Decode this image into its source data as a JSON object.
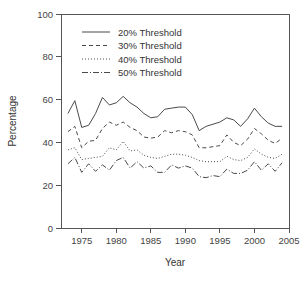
{
  "chart_data": {
    "type": "line",
    "title": "",
    "xlabel": "Year",
    "ylabel": "Percentage",
    "xlim": [
      1972,
      2005
    ],
    "ylim": [
      0,
      100
    ],
    "xticks": [
      1975,
      1980,
      1985,
      1990,
      1995,
      2000,
      2005
    ],
    "xtick_labels": [
      "1975",
      "1980",
      "1985",
      "1990",
      "1995",
      "2000",
      "2005"
    ],
    "yticks": [
      0,
      20,
      40,
      60,
      80,
      100
    ],
    "ytick_labels": [
      "0",
      "20",
      "40",
      "60",
      "80",
      "100"
    ],
    "grid": false,
    "legend_position": "top-left",
    "x": [
      1973,
      1974,
      1975,
      1976,
      1977,
      1978,
      1979,
      1980,
      1981,
      1982,
      1983,
      1984,
      1985,
      1986,
      1987,
      1988,
      1989,
      1990,
      1991,
      1992,
      1993,
      1994,
      1995,
      1996,
      1997,
      1998,
      1999,
      2000,
      2001,
      2002,
      2003,
      2004
    ],
    "series": [
      {
        "name": "20% Threshold",
        "dash": "none",
        "color": "#4a4a4a",
        "values": [
          53.5,
          59.5,
          47.0,
          48.0,
          53.5,
          61.0,
          57.5,
          58.5,
          61.5,
          58.5,
          56.5,
          53.5,
          51.5,
          52.0,
          55.5,
          56.0,
          56.5,
          56.5,
          53.0,
          45.5,
          47.5,
          48.5,
          49.5,
          51.5,
          50.5,
          47.5,
          51.0,
          56.0,
          52.0,
          49.0,
          47.5,
          47.5
        ]
      },
      {
        "name": "30% Threshold",
        "dash": "4,3",
        "color": "#4a4a4a",
        "values": [
          45.0,
          47.5,
          37.5,
          40.5,
          41.0,
          46.5,
          49.5,
          48.0,
          49.5,
          47.0,
          45.5,
          42.5,
          42.0,
          42.5,
          45.5,
          44.5,
          45.5,
          45.0,
          43.5,
          37.5,
          37.5,
          38.0,
          38.5,
          43.5,
          40.0,
          38.5,
          41.5,
          46.5,
          44.0,
          41.0,
          39.5,
          42.0
        ]
      },
      {
        "name": "40% Threshold",
        "dash": "1,2",
        "color": "#4a4a4a",
        "values": [
          36.5,
          37.5,
          32.0,
          32.5,
          33.0,
          33.5,
          37.5,
          36.5,
          40.5,
          36.0,
          36.5,
          34.0,
          33.0,
          32.5,
          33.5,
          34.5,
          34.5,
          34.0,
          33.0,
          31.5,
          31.0,
          31.0,
          31.0,
          33.5,
          32.0,
          31.5,
          33.0,
          37.0,
          34.5,
          33.0,
          32.5,
          34.5
        ]
      },
      {
        "name": "50% Threshold",
        "dash": "6,2,1,2",
        "color": "#4a4a4a",
        "values": [
          30.0,
          33.0,
          26.0,
          30.0,
          26.5,
          29.5,
          27.0,
          31.5,
          33.0,
          28.0,
          31.0,
          28.0,
          29.0,
          26.0,
          26.0,
          29.5,
          28.0,
          29.0,
          28.0,
          24.0,
          23.5,
          24.5,
          24.0,
          27.5,
          25.5,
          25.5,
          27.0,
          31.0,
          27.0,
          30.0,
          26.5,
          30.5
        ]
      }
    ],
    "legend_entries": [
      "20% Threshold",
      "30% Threshold",
      "40% Threshold",
      "50% Threshold"
    ]
  },
  "plot_geometry": {
    "left": 61,
    "right": 289,
    "top": 14,
    "bottom": 228
  }
}
